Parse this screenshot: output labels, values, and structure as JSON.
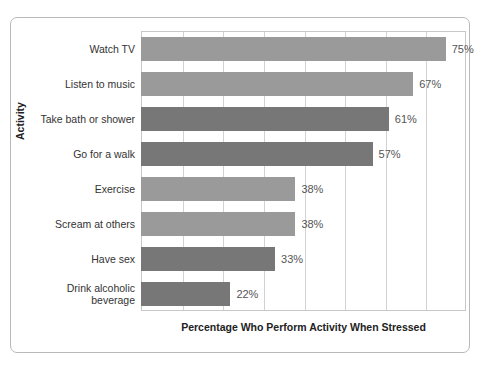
{
  "chart_data": {
    "type": "bar",
    "orientation": "horizontal",
    "title": "",
    "xlabel": "Percentage Who Perform Activity When Stressed",
    "ylabel": "Activity",
    "categories": [
      "Watch TV",
      "Listen to music",
      "Take bath or shower",
      "Go for a walk",
      "Exercise",
      "Scream at others",
      "Have sex",
      "Drink alcoholic beverage"
    ],
    "values": [
      75,
      67,
      61,
      57,
      38,
      38,
      33,
      22
    ],
    "value_labels": [
      "75%",
      "67%",
      "61%",
      "57%",
      "38%",
      "38%",
      "33%",
      "22%"
    ],
    "bar_colors": [
      "#9a9a9a",
      "#9a9a9a",
      "#777777",
      "#777777",
      "#9a9a9a",
      "#9a9a9a",
      "#777777",
      "#777777"
    ],
    "xlim": [
      0,
      80
    ],
    "gridlines": [
      10,
      20,
      30,
      40,
      50,
      60,
      70,
      80
    ],
    "grid": true,
    "legend": "none",
    "axis_tick_labels_visible": false
  },
  "figure": {
    "bottom_caption": ""
  }
}
